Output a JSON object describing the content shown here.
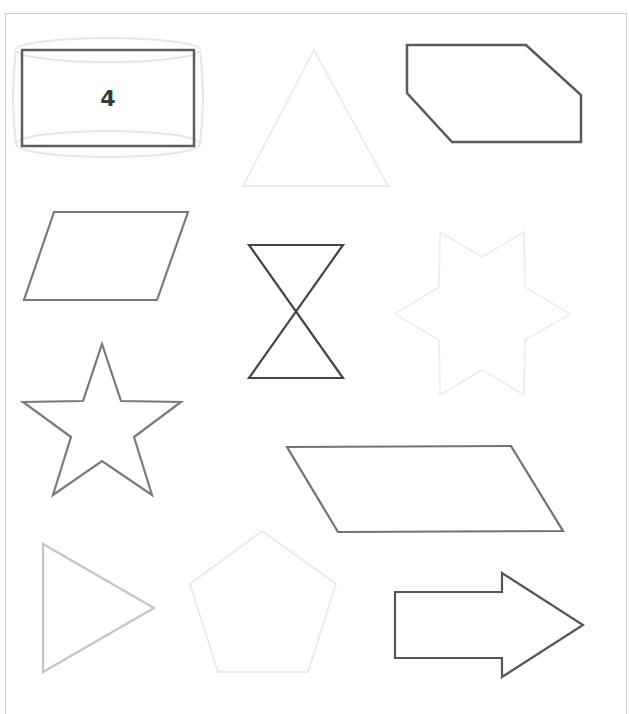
{
  "worksheet": {
    "shapes": [
      {
        "id": "rectangle",
        "label": "4",
        "stroke": "#5e5e5e",
        "points": "22,50 194,50 194,146 22,146",
        "cylinder_ghost_stroke": "#e4e4e4"
      },
      {
        "id": "triangle-up",
        "stroke": "#ececec",
        "points": "314,50 388,186 243,186"
      },
      {
        "id": "hexagon",
        "stroke": "#5a5a5a",
        "points": "407,45 526,45 581,95 581,142 452,142 407,93"
      },
      {
        "id": "parallelogram-left",
        "stroke": "#7a7a7a",
        "points": "54,212 188,212 157,300 24,300"
      },
      {
        "id": "hourglass",
        "stroke": "#444444",
        "points": "249,245 343,245 249,378 343,378"
      },
      {
        "id": "six-point-star",
        "stroke": "#f0f0f0",
        "points": "440,232 482,257 524,232 525,287 570,314 525,340 524,395 482,370 440,395 439,340 395,314 439,287"
      },
      {
        "id": "five-point-star",
        "stroke": "#7a7a7a",
        "points": "102,344 121,401 181,402 134,437 152,495 102,461 53,495 71,437 23,402 83,401"
      },
      {
        "id": "parallelogram-wide",
        "stroke": "#727272",
        "points": "287,447 511,446 563,531 338,532"
      },
      {
        "id": "triangle-right",
        "stroke": "#c4c4c4",
        "points": "43,544 154,608 43,672"
      },
      {
        "id": "pentagon",
        "stroke": "#ececec",
        "points": "262,531 336,584 308,672 218,672 190,584"
      },
      {
        "id": "arrow-right",
        "stroke": "#555555",
        "points": "395,592 502,592 502,573 583,625 502,677 502,658 395,658"
      }
    ]
  }
}
